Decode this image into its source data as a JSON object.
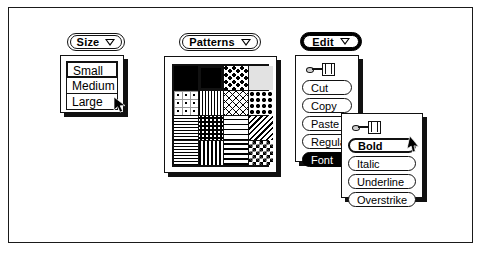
{
  "figure": {
    "background": "#ffffff",
    "ink": "#111111"
  },
  "size_widget": {
    "button": {
      "label": "Size",
      "icon": "chevron-down-icon"
    },
    "items": [
      {
        "label": "Small",
        "selected": true
      },
      {
        "label": "Medium",
        "selected": false
      },
      {
        "label": "Large",
        "selected": false
      }
    ],
    "cursor": "arrow-pointer"
  },
  "patterns_widget": {
    "button": {
      "label": "Patterns",
      "icon": "chevron-down-icon"
    },
    "grid": {
      "rows": 4,
      "cols": 4
    },
    "swatches": [
      {
        "name": "solid-black",
        "style": "p-solid",
        "selected": false
      },
      {
        "name": "solid-black-selected",
        "style": "p-solid",
        "selected": true
      },
      {
        "name": "wave-texture",
        "style": "p-wave",
        "selected": false
      },
      {
        "name": "light-gray",
        "style": "p-lightgray",
        "selected": false
      },
      {
        "name": "boxed-dots",
        "style": "p-boxdots",
        "selected": false
      },
      {
        "name": "vertical-lines",
        "style": "p-vlines",
        "selected": false
      },
      {
        "name": "chain-link",
        "style": "p-chain",
        "selected": false
      },
      {
        "name": "large-dots",
        "style": "p-bigdots",
        "selected": false
      },
      {
        "name": "crosshatch",
        "style": "p-crosshatch",
        "selected": false
      },
      {
        "name": "dense-dots",
        "style": "p-densedots",
        "selected": false
      },
      {
        "name": "brick",
        "style": "p-brick",
        "selected": false
      },
      {
        "name": "diagonal-lines",
        "style": "p-diag",
        "selected": false
      },
      {
        "name": "horizontal-lines",
        "style": "p-hlines",
        "selected": false
      },
      {
        "name": "dashed-texture",
        "style": "p-dashed",
        "selected": false
      },
      {
        "name": "grid",
        "style": "p-grid",
        "selected": false
      },
      {
        "name": "checkerboard",
        "style": "p-checker",
        "selected": false
      }
    ],
    "cursor": "arrow-pointer"
  },
  "edit_widget": {
    "button": {
      "label": "Edit",
      "icon": "chevron-down-icon"
    },
    "pushpin": "pushpin-icon",
    "items": [
      {
        "label": "Cut",
        "selected": false
      },
      {
        "label": "Copy",
        "selected": false
      },
      {
        "label": "Paste",
        "selected": false
      },
      {
        "label": "Regular",
        "selected": false
      },
      {
        "label": "Font",
        "selected": true
      }
    ]
  },
  "font_submenu": {
    "pushpin": "pushpin-icon",
    "items": [
      {
        "label": "Bold",
        "highlighted": true
      },
      {
        "label": "Italic",
        "highlighted": false
      },
      {
        "label": "Underline",
        "highlighted": false
      },
      {
        "label": "Overstrike",
        "highlighted": false
      }
    ],
    "cursor": "arrow-pointer"
  }
}
